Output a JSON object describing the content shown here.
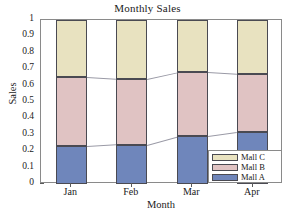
{
  "chart_data": {
    "type": "bar",
    "subtype": "stacked",
    "title": "Monthly Sales",
    "xlabel": "Month",
    "ylabel": "Sales",
    "categories": [
      "Jan",
      "Feb",
      "Mar",
      "Apr"
    ],
    "series": [
      {
        "name": "Mall A",
        "color": "#6f86bb",
        "values": [
          0.23,
          0.24,
          0.29,
          0.315
        ]
      },
      {
        "name": "Mall B",
        "color": "#e0c3c3",
        "values": [
          0.42,
          0.4,
          0.39,
          0.355
        ]
      },
      {
        "name": "Mall C",
        "color": "#e8e2c0",
        "values": [
          0.35,
          0.36,
          0.32,
          0.33
        ]
      }
    ],
    "cumulative_tops": {
      "Mall A": [
        0.23,
        0.24,
        0.29,
        0.315
      ],
      "Mall B": [
        0.65,
        0.64,
        0.68,
        0.67
      ],
      "Mall C": [
        1.0,
        1.0,
        1.0,
        1.0
      ]
    },
    "ylim": [
      0,
      1
    ],
    "ytick_labels": [
      "1",
      "0.9",
      "0.8",
      "0.7",
      "0.6",
      "0.5",
      "0.4",
      "0.3",
      "0.2",
      "0.1",
      "0"
    ],
    "ytick_values": [
      1,
      0.9,
      0.8,
      0.7,
      0.6,
      0.5,
      0.4,
      0.3,
      0.2,
      0.1,
      0
    ],
    "grid": false,
    "legend_position": "bottom-right",
    "legend_entries": [
      "Mall C",
      "Mall B",
      "Mall A"
    ],
    "connectors": true
  },
  "legend": {
    "rows": [
      {
        "label": "Mall C",
        "color": "#e8e2c0"
      },
      {
        "label": "Mall B",
        "color": "#e0c3c3"
      },
      {
        "label": "Mall A",
        "color": "#6f86bb"
      }
    ]
  }
}
